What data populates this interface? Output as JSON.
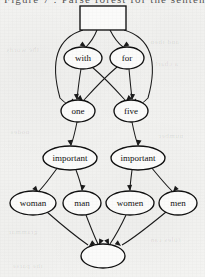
{
  "page": {
    "background_color": "#f4f4f2",
    "ink_color": "#111111",
    "cropped_header_text": "Figure 7 : Parse forest for the sentence",
    "bleed_through_fragments": [
      {
        "text": "the words",
        "x": 6,
        "y": 46,
        "size": 7,
        "rotate": -1
      },
      {
        "text": "and then",
        "x": 150,
        "y": 38,
        "size": 7,
        "rotate": 0
      },
      {
        "text": "a chart",
        "x": 155,
        "y": 60,
        "size": 7,
        "rotate": 1
      },
      {
        "text": "nodes",
        "x": 10,
        "y": 128,
        "size": 7,
        "rotate": 0
      },
      {
        "text": "number",
        "x": 158,
        "y": 132,
        "size": 7,
        "rotate": 0
      },
      {
        "text": "grammar",
        "x": 8,
        "y": 228,
        "size": 7,
        "rotate": 0
      },
      {
        "text": "rules can",
        "x": 150,
        "y": 236,
        "size": 7,
        "rotate": -1
      },
      {
        "text": "the parse",
        "x": 12,
        "y": 262,
        "size": 7,
        "rotate": 0
      }
    ]
  },
  "graph": {
    "title": "parse-forest-dag",
    "nodes": [
      {
        "id": "root",
        "label": "",
        "shape": "rect",
        "cx": 103,
        "cy": 18,
        "rw": 23,
        "rh": 12,
        "font_size": 8
      },
      {
        "id": "with",
        "label": "with",
        "shape": "ellipse",
        "cx": 83,
        "cy": 58,
        "rw": 19,
        "rh": 11,
        "font_size": 9
      },
      {
        "id": "for",
        "label": "for",
        "shape": "ellipse",
        "cx": 127,
        "cy": 58,
        "rw": 17,
        "rh": 11,
        "font_size": 9
      },
      {
        "id": "one",
        "label": "one",
        "shape": "ellipse",
        "cx": 78,
        "cy": 111,
        "rw": 17,
        "rh": 11,
        "font_size": 9
      },
      {
        "id": "five",
        "label": "five",
        "shape": "ellipse",
        "cx": 131,
        "cy": 111,
        "rw": 17,
        "rh": 11,
        "font_size": 9
      },
      {
        "id": "important_l",
        "label": "important",
        "shape": "ellipse",
        "cx": 70,
        "cy": 158,
        "rw": 27,
        "rh": 12,
        "font_size": 9
      },
      {
        "id": "important_r",
        "label": "important",
        "shape": "ellipse",
        "cx": 138,
        "cy": 158,
        "rw": 27,
        "rh": 12,
        "font_size": 9
      },
      {
        "id": "woman",
        "label": "woman",
        "shape": "ellipse",
        "cx": 33,
        "cy": 203,
        "rw": 23,
        "rh": 12,
        "font_size": 9
      },
      {
        "id": "man",
        "label": "man",
        "shape": "ellipse",
        "cx": 82,
        "cy": 203,
        "rw": 19,
        "rh": 12,
        "font_size": 9
      },
      {
        "id": "women",
        "label": "women",
        "shape": "ellipse",
        "cx": 130,
        "cy": 203,
        "rw": 24,
        "rh": 12,
        "font_size": 9
      },
      {
        "id": "men",
        "label": "men",
        "shape": "ellipse",
        "cx": 178,
        "cy": 203,
        "rw": 19,
        "rh": 12,
        "font_size": 9
      },
      {
        "id": "sink",
        "label": "",
        "shape": "ellipse",
        "cx": 103,
        "cy": 256,
        "rw": 22,
        "rh": 12,
        "font_size": 8
      }
    ],
    "edges": [
      {
        "from": "root",
        "to": "with",
        "path": "M 97,30 C 93,40 89,44 86,47",
        "head": [
          86,
          47,
          -55
        ]
      },
      {
        "from": "root",
        "to": "for",
        "path": "M 110,30 C 115,40 119,44 123,47",
        "head": [
          123,
          47,
          55
        ]
      },
      {
        "from": "root",
        "to": "one",
        "path": "M 83,30 C 57,38 50,62 60,98 C 64,102 66,104 68,104",
        "head": [
          69,
          104,
          55
        ]
      },
      {
        "from": "root",
        "to": "five",
        "path": "M 124,30 C 151,38 158,62 148,98 C 144,102 142,104 140,104",
        "head": [
          139,
          104,
          -55
        ]
      },
      {
        "from": "with",
        "to": "one",
        "path": "M 81,69 C 79,80 78,90 77,99",
        "head": [
          77,
          100,
          -6
        ]
      },
      {
        "from": "with",
        "to": "five",
        "path": "M 92,67 C 105,78 116,90 125,100",
        "head": [
          126,
          101,
          46
        ]
      },
      {
        "from": "for",
        "to": "one",
        "path": "M 117,67 C 104,78 93,90 84,100",
        "head": [
          83,
          101,
          -46
        ]
      },
      {
        "from": "for",
        "to": "five",
        "path": "M 129,69 C 130,80 131,90 132,99",
        "head": [
          132,
          100,
          6
        ]
      },
      {
        "from": "one",
        "to": "important_l",
        "path": "M 77,122 C 75,132 73,140 71,145",
        "head": [
          71,
          146,
          -10
        ]
      },
      {
        "from": "five",
        "to": "important_r",
        "path": "M 132,122 C 134,132 136,140 138,145",
        "head": [
          138,
          146,
          10
        ]
      },
      {
        "from": "important_l",
        "to": "woman",
        "path": "M 58,167 C 50,178 44,186 39,191",
        "head": [
          38,
          192,
          -40
        ]
      },
      {
        "from": "important_l",
        "to": "man",
        "path": "M 76,170 C 79,178 81,185 82,190",
        "head": [
          82,
          191,
          10
        ]
      },
      {
        "from": "important_r",
        "to": "women",
        "path": "M 132,170 C 131,178 130,185 130,190",
        "head": [
          130,
          191,
          -4
        ]
      },
      {
        "from": "important_r",
        "to": "men",
        "path": "M 151,167 C 160,178 167,186 172,191",
        "head": [
          173,
          192,
          40
        ]
      },
      {
        "from": "woman",
        "to": "sink",
        "path": "M 47,212 C 63,226 78,238 88,245",
        "head": [
          89,
          246,
          52
        ]
      },
      {
        "from": "man",
        "to": "sink",
        "path": "M 86,215 C 91,228 95,238 98,244",
        "head": [
          99,
          245,
          24
        ]
      },
      {
        "from": "women",
        "to": "sink",
        "path": "M 126,215 C 120,228 114,238 110,244",
        "head": [
          109,
          245,
          -24
        ]
      },
      {
        "from": "men",
        "to": "sink",
        "path": "M 166,212 C 149,226 134,238 122,245",
        "head": [
          121,
          246,
          -52
        ]
      }
    ]
  }
}
